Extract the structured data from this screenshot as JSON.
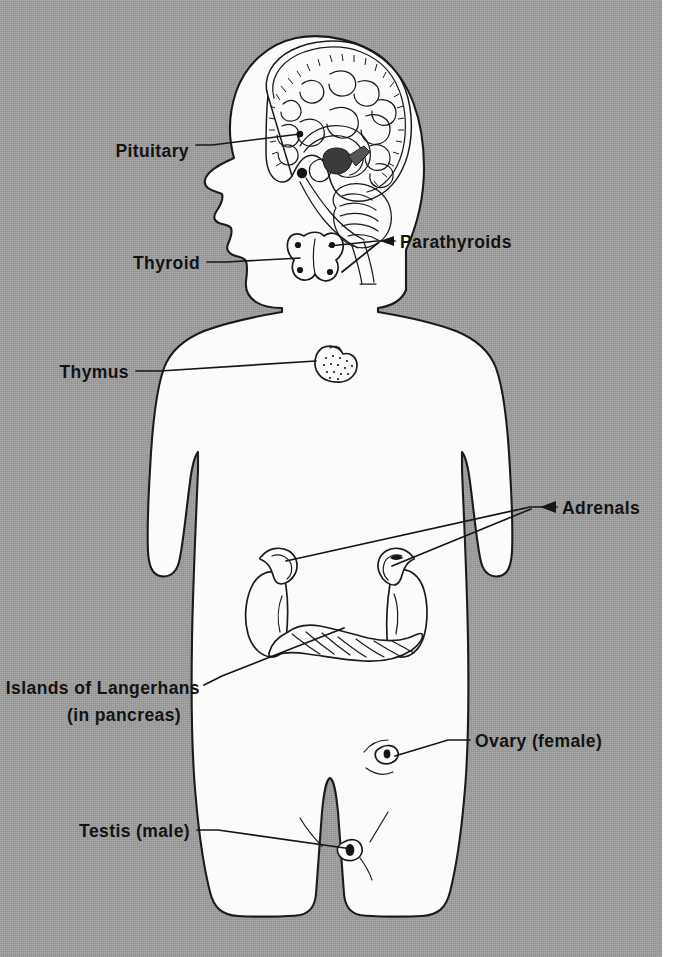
{
  "figure": {
    "background_color": "#9e9e9e",
    "ink_color": "#161616",
    "body_fill_color": "#fbfbf9"
  },
  "labels": [
    {
      "id": "pituitary",
      "text": "Pituitary",
      "align": "end",
      "x": 189,
      "y": 151,
      "leader": "M 196,145 L 212,145 L 300,134",
      "marker": "black-dot",
      "organ": "pituitary-gland"
    },
    {
      "id": "thyroid",
      "text": "Thyroid",
      "align": "end",
      "x": 200,
      "y": 268,
      "leader": "M 207,262 L 226,262 L 300,258",
      "marker": "line",
      "organ": "thyroid-gland"
    },
    {
      "id": "parathyroids",
      "text": "Parathyroids",
      "align": "start",
      "x": 400,
      "y": 247,
      "leader": "M 395,241 L 377,241 L 329,246 M 377,243 L 342,272",
      "marker": "arrow",
      "organ": "parathyroid-glands"
    },
    {
      "id": "thymus",
      "text": "Thymus",
      "align": "end",
      "x": 129,
      "y": 377,
      "leader": "M 136,371 L 160,371 L 316,361",
      "marker": "line",
      "organ": "thymus-gland"
    },
    {
      "id": "adrenals",
      "text": "Adrenals",
      "align": "start",
      "x": 562,
      "y": 513,
      "leader": "M 557,507 L 530,507 L 286,561 M 530,509 L 392,566",
      "marker": "arrow",
      "organ": "adrenal-glands"
    },
    {
      "id": "islands-of-langerhans",
      "text": "Islands of Langerhans",
      "align": "end",
      "x": 200,
      "y": 692,
      "line2": "(in pancreas)",
      "line2_x": 124,
      "line2_y": 718,
      "leader": "M 204,685 L 222,676 L 344,628",
      "marker": "line",
      "organ": "pancreas-islets"
    },
    {
      "id": "ovary",
      "text": "Ovary (female)",
      "align": "start",
      "x": 475,
      "y": 746,
      "leader": "M 470,740 L 448,740 L 395,756",
      "marker": "line",
      "organ": "ovary"
    },
    {
      "id": "testis",
      "text": "Testis (male)",
      "align": "end",
      "x": 190,
      "y": 836,
      "leader": "M 197,830 L 218,830 L 352,849",
      "marker": "line",
      "organ": "testis"
    }
  ],
  "organs": [
    {
      "id": "brain",
      "name": "brain-midsagittal-section",
      "label": "Brain (mid-sagittal section)"
    },
    {
      "id": "pituitary-gland",
      "name": "pituitary-gland",
      "label": "Pituitary"
    },
    {
      "id": "thyroid-gland",
      "name": "thyroid-gland",
      "label": "Thyroid"
    },
    {
      "id": "parathyroid-glands",
      "name": "parathyroid-glands",
      "label": "Parathyroids",
      "count": 4
    },
    {
      "id": "thymus-gland",
      "name": "thymus-gland",
      "label": "Thymus"
    },
    {
      "id": "adrenal-glands",
      "name": "adrenal-glands",
      "label": "Adrenals",
      "count": 2
    },
    {
      "id": "kidneys",
      "name": "kidneys",
      "label": "Kidneys",
      "count": 2
    },
    {
      "id": "pancreas-islets",
      "name": "pancreas",
      "label": "Islands of Langerhans (in pancreas)"
    },
    {
      "id": "ovary",
      "name": "ovary",
      "label": "Ovary (female)"
    },
    {
      "id": "testis",
      "name": "testis",
      "label": "Testis (male)"
    }
  ]
}
